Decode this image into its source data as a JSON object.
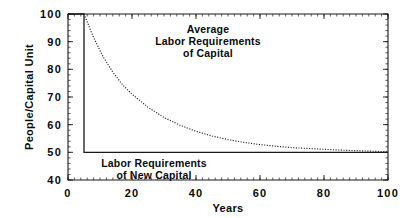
{
  "chart_data": {
    "type": "line",
    "title": "",
    "xlabel": "Years",
    "ylabel": "People/Capital Unit",
    "xlim": [
      0,
      100
    ],
    "ylim": [
      40,
      100
    ],
    "grid": false,
    "legend": "none",
    "x_ticks": [
      0,
      20,
      40,
      60,
      80,
      100
    ],
    "x_tick_labels": [
      "0",
      "20",
      "40",
      "60",
      "80",
      "100"
    ],
    "y_ticks": [
      40,
      50,
      60,
      70,
      80,
      90,
      100
    ],
    "y_tick_labels": [
      "40",
      "50",
      "60",
      "70",
      "80",
      "90",
      "100"
    ],
    "x_minor_tick_interval": 2,
    "y_minor_tick_interval": 2,
    "frame": "box-all-sides-inward-ticks",
    "series": [
      {
        "name": "Labor Requirements of New Capital",
        "style": "solid",
        "shape": "step-drop",
        "x": [
          0,
          5,
          5,
          100
        ],
        "values": [
          100,
          100,
          50,
          50
        ]
      },
      {
        "name": "Average Labor Requirements of Capital",
        "style": "dotted",
        "shape": "exponential-decay",
        "asymptote": 50,
        "x": [
          5,
          8,
          11,
          14,
          17,
          20,
          25,
          30,
          35,
          40,
          45,
          50,
          55,
          60,
          65,
          70,
          75,
          80,
          85,
          90,
          95,
          100
        ],
        "values": [
          100,
          91.5,
          84.5,
          79.0,
          74.5,
          71.0,
          66.3,
          62.6,
          59.8,
          57.6,
          55.9,
          54.6,
          53.6,
          52.8,
          52.2,
          51.7,
          51.4,
          51.1,
          50.8,
          50.6,
          50.4,
          50.2
        ]
      }
    ],
    "annotations": [
      {
        "id": "annotation-average",
        "lines": [
          "Average",
          "Labor Requirements",
          "of Capital"
        ],
        "x_data": 45,
        "y_data": 91
      },
      {
        "id": "annotation-new-capital",
        "lines": [
          "Labor Requirements",
          "of New Capital"
        ],
        "x_data": 27,
        "y_data": 46.5
      }
    ]
  }
}
